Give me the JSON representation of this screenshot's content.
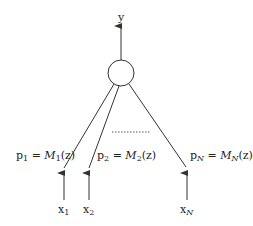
{
  "diagram": {
    "output_label": "y",
    "node": {
      "cx": 121,
      "cy": 73,
      "r": 13
    },
    "branches": [
      {
        "prob_var": "p",
        "prob_sub": "1",
        "model": "M",
        "model_sub": "1",
        "arg": "(z)",
        "input_var": "x",
        "input_sub": "1"
      },
      {
        "prob_var": "p",
        "prob_sub": "2",
        "model": "M",
        "model_sub": "2",
        "arg": "(z)",
        "input_var": "x",
        "input_sub": "2"
      },
      {
        "prob_var": "p",
        "prob_sub": "N",
        "model": "M",
        "model_sub": "N",
        "arg": "(z)",
        "input_var": "x",
        "input_sub": "N"
      }
    ],
    "equals": "=",
    "colors": {
      "line": "#333333",
      "dotted": "#555555"
    }
  }
}
